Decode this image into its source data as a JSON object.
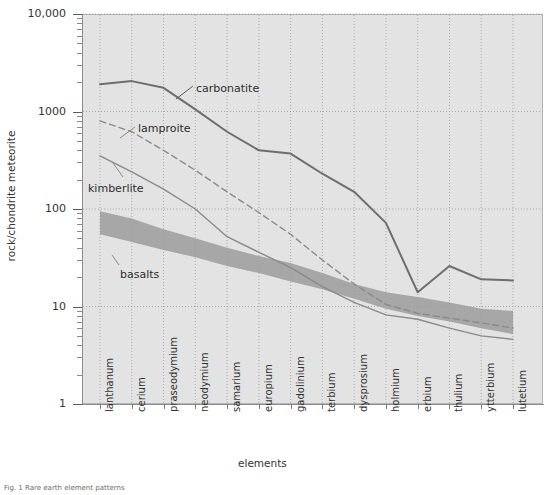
{
  "chart_data": {
    "type": "line",
    "title": "",
    "xlabel": "elements",
    "ylabel": "rock/chondrite meteorite",
    "yscale": "log",
    "ylim": [
      1,
      10000
    ],
    "ytick_labels": [
      "10,000",
      "1000",
      "100",
      "10",
      "1"
    ],
    "ytick_values": [
      10000,
      1000,
      100,
      10,
      1
    ],
    "grid": true,
    "legend_position": "inline-annotations",
    "categories": [
      "lanthanum",
      "cerium",
      "praseodymium",
      "neodymium",
      "samarium",
      "europium",
      "gadolinium",
      "terbium",
      "dysprosium",
      "holmium",
      "erbium",
      "thulium",
      "ytterbium",
      "lutetium"
    ],
    "series": [
      {
        "name": "carbonatite",
        "style": "solid",
        "color": "#6e6e6e",
        "values": [
          1900,
          2050,
          1750,
          1050,
          620,
          400,
          370,
          230,
          150,
          72,
          14,
          26,
          19,
          18.5
        ]
      },
      {
        "name": "lamproite",
        "style": "dashed",
        "color": "#8a8a8a",
        "values": [
          800,
          620,
          400,
          250,
          150,
          92,
          55,
          30,
          17,
          10.5,
          8.5,
          7.6,
          6.8,
          6.0
        ]
      },
      {
        "name": "kimberlite",
        "style": "solid",
        "color": "#8a8a8a",
        "values": [
          350,
          240,
          160,
          100,
          52,
          36,
          25,
          16,
          11,
          8.2,
          7.4,
          6.0,
          5.0,
          4.6
        ]
      },
      {
        "name": "basalts",
        "style": "band",
        "color": "#9c9c9c",
        "band_upper": [
          95,
          80,
          62,
          50,
          40,
          33,
          28,
          22,
          17,
          14,
          12.5,
          11,
          9.5,
          9.0
        ],
        "band_lower": [
          55,
          46,
          38,
          32,
          26,
          22,
          18,
          15,
          12,
          9.5,
          8.0,
          7.0,
          6.0,
          5.2
        ]
      }
    ],
    "annotations": [
      {
        "text": "carbonatite",
        "x_px": 196,
        "y_px": 82
      },
      {
        "text": "lamproite",
        "x_px": 138,
        "y_px": 122
      },
      {
        "text": "kimberlite",
        "x_px": 88,
        "y_px": 182
      },
      {
        "text": "basalts",
        "x_px": 120,
        "y_px": 268
      }
    ]
  },
  "caption": {
    "text": "Fig. 1 Rare earth element patterns"
  }
}
